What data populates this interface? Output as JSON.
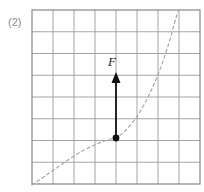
{
  "figure": {
    "index_label": "(2)",
    "width": 204,
    "height": 192,
    "background_color": "#ffffff"
  },
  "grid": {
    "columns": 8,
    "rows": 8,
    "left": 32,
    "top": 10,
    "right": 200,
    "bottom": 184,
    "cell_width": 21,
    "cell_height": 21.75,
    "line_color": "#9a9a9a",
    "border_color": "#7d7d7d",
    "line_width": 0.9,
    "border_width": 1.1
  },
  "curve": {
    "name": "dashed-trajectory",
    "style": "dashed",
    "color": "#a8a8a8",
    "dash_pattern": "3 3",
    "width": 1.2,
    "points": [
      [
        32,
        185
      ],
      [
        45,
        176
      ],
      [
        58,
        167
      ],
      [
        71,
        158
      ],
      [
        84,
        150
      ],
      [
        97,
        144
      ],
      [
        110,
        139
      ],
      [
        116,
        138
      ],
      [
        126,
        130
      ],
      [
        138,
        115
      ],
      [
        149,
        95
      ],
      [
        159,
        72
      ],
      [
        168,
        46
      ],
      [
        176,
        18
      ],
      [
        179,
        10
      ]
    ]
  },
  "force_arrow": {
    "label": "F",
    "color": "#111111",
    "shaft_width": 1.8,
    "tail_x": 116,
    "tail_y": 138,
    "tip_x": 116,
    "tip_y": 72,
    "head_width": 9,
    "head_length": 11,
    "label_x": 108,
    "label_y": 66
  },
  "point_marker": {
    "name": "curve-point",
    "x": 116,
    "y": 138,
    "radius": 3.4,
    "color": "#111111"
  }
}
